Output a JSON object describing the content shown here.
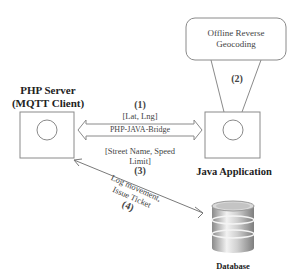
{
  "nodes": {
    "php_server": {
      "title_line1": "PHP Server",
      "title_line2": "(MQTT Client)"
    },
    "java_app": {
      "title": "Java Application"
    },
    "geocoding": {
      "line1": "Offline Reverse",
      "line2": "Geocoding"
    },
    "database": {
      "title": "Database"
    }
  },
  "edges": {
    "step1": {
      "number": "(1)",
      "label": "[Lat, Lng]"
    },
    "bridge": {
      "label": "PHP-JAVA-Bridge"
    },
    "step3": {
      "line1": "[Street Name, Speed",
      "line2": "Limit]",
      "number": "(3)"
    },
    "step2": {
      "number": "(2)"
    },
    "step4": {
      "line1": "Log movement,",
      "line2": "Issue Ticket",
      "number": "(4)"
    }
  },
  "colors": {
    "stroke": "#7a7a7a",
    "text": "#333333",
    "db_light": "#e8e8e8",
    "db_dark": "#8a8a8a"
  }
}
